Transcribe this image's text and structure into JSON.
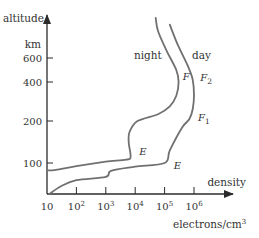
{
  "chart_data": {
    "type": "line",
    "title": "",
    "xlabel": "density",
    "xunit": "electrons/cm³",
    "ylabel": "altitude",
    "yunit": "km",
    "xscale": "log",
    "xlim": [
      10,
      1000000
    ],
    "x_ticks": [
      {
        "value": 10,
        "label": "10",
        "base": "10",
        "exp": ""
      },
      {
        "value": 100,
        "label": "10²",
        "base": "10",
        "exp": "2"
      },
      {
        "value": 1000,
        "label": "10³",
        "base": "10",
        "exp": "3"
      },
      {
        "value": 10000,
        "label": "10⁴",
        "base": "10",
        "exp": "4"
      },
      {
        "value": 100000,
        "label": "10⁵",
        "base": "10",
        "exp": "5"
      },
      {
        "value": 1000000,
        "label": "10⁶",
        "base": "10",
        "exp": "6"
      }
    ],
    "y_ticks": [
      {
        "value": 100,
        "label": "100"
      },
      {
        "value": 200,
        "label": "200"
      },
      {
        "value": 400,
        "label": "400"
      },
      {
        "value": 600,
        "label": "600"
      }
    ],
    "series": [
      {
        "name": "night",
        "label": "night",
        "points": [
          [
            10,
            76
          ],
          [
            20,
            78
          ],
          [
            100,
            90
          ],
          [
            1000,
            103
          ],
          [
            5000,
            108
          ],
          [
            7000,
            115
          ],
          [
            6000,
            150
          ],
          [
            6500,
            175
          ],
          [
            12000,
            200
          ],
          [
            60000,
            235
          ],
          [
            150000,
            275
          ],
          [
            250000,
            330
          ],
          [
            300000,
            400
          ],
          [
            250000,
            500
          ],
          [
            120000,
            650
          ],
          [
            60000,
            800
          ],
          [
            50000,
            900
          ]
        ],
        "layer_labels": [
          {
            "text": "E",
            "near": [
              10000,
              118
            ]
          },
          {
            "text": "F",
            "near": [
              300000,
              420
            ]
          }
        ]
      },
      {
        "name": "day",
        "label": "day",
        "points": [
          [
            12,
            0
          ],
          [
            30,
            25
          ],
          [
            100,
            45
          ],
          [
            1000,
            55
          ],
          [
            1500,
            75
          ],
          [
            10000,
            88
          ],
          [
            100000,
            100
          ],
          [
            150000,
            130
          ],
          [
            400000,
            185
          ],
          [
            700000,
            210
          ],
          [
            900000,
            260
          ],
          [
            1000000,
            330
          ],
          [
            900000,
            420
          ],
          [
            600000,
            540
          ],
          [
            280000,
            700
          ],
          [
            150000,
            850
          ]
        ],
        "layer_labels": [
          {
            "text": "E",
            "near": [
              150000,
              80
            ]
          },
          {
            "text": "F",
            "sub": "1",
            "near": [
              1000000,
              200
            ]
          },
          {
            "text": "F",
            "sub": "2",
            "near": [
              1200000,
              410
            ]
          }
        ]
      }
    ],
    "grid": false,
    "legend": "none"
  }
}
